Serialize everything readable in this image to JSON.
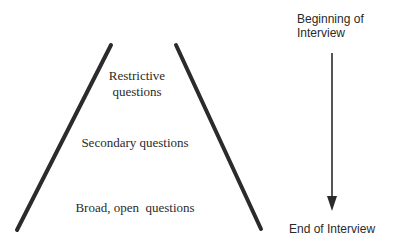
{
  "diagram": {
    "type": "interview-funnel",
    "funnel": {
      "shape": "inverted-funnel (narrow top, wide bottom)",
      "levels": [
        {
          "position": "top",
          "label_lines": [
            "Restrictive",
            "questions"
          ]
        },
        {
          "position": "middle",
          "label": "Secondary questions"
        },
        {
          "position": "bottom",
          "label": "Broad, open  questions"
        }
      ],
      "line_color": "#2b2b2b"
    },
    "timeline": {
      "start_label_lines": [
        "Beginning of",
        "Interview"
      ],
      "end_label": "End of Interview",
      "direction": "downward",
      "arrow_color": "#2b2b2b"
    }
  }
}
